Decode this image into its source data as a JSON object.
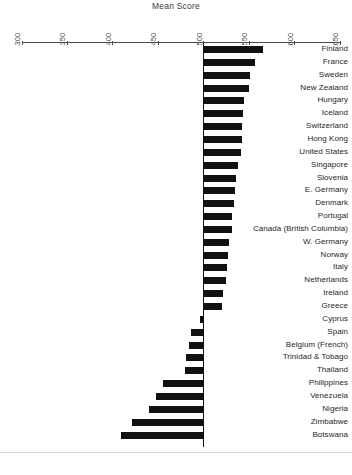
{
  "chart_data": {
    "type": "bar",
    "orientation": "horizontal",
    "title": "Mean Score",
    "xlabel": "",
    "ylabel": "",
    "xlim": [
      300,
      650
    ],
    "baseline": 500,
    "grid": false,
    "legend": null,
    "bar_color": "#111111",
    "axis_color": "#4a4a4a",
    "xticks": [
      300,
      350,
      400,
      450,
      500,
      550,
      600,
      650
    ],
    "xtick_labels": [
      "300",
      "350",
      "400",
      "450",
      "500",
      "550",
      "600",
      "650"
    ],
    "categories": [
      "Finland",
      "France",
      "Sweden",
      "New Zealand",
      "Hungary",
      "Iceland",
      "Switzerland",
      "Hong Kong",
      "United States",
      "Singapore",
      "Slovenia",
      "E. Germany",
      "Denmark",
      "Portugal",
      "Canada (British Columbia)",
      "W. Germany",
      "Norway",
      "Italy",
      "Netherlands",
      "Ireland",
      "Greece",
      "Cyprus",
      "Spain",
      "Belgium (French)",
      "Trinidad & Tobago",
      "Thailand",
      "Philippines",
      "Venezuela",
      "Nigeria",
      "Zimbabwe",
      "Botswana"
    ],
    "values": [
      565,
      556,
      551,
      550,
      544,
      543,
      542,
      542,
      541,
      538,
      536,
      534,
      533,
      531,
      531,
      528,
      527,
      526,
      525,
      521,
      520,
      496,
      486,
      484,
      480,
      479,
      455,
      447,
      440,
      421,
      409
    ],
    "value_unit": "mean score",
    "caption": ""
  },
  "bottom": {
    "caption": ""
  }
}
